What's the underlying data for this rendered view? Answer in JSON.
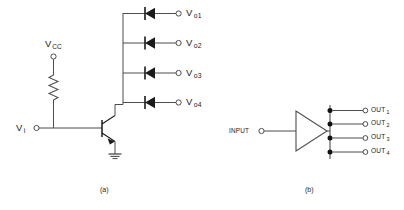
{
  "figure": {
    "background_color": "#ffffff",
    "line_color": "#4d4d4d",
    "symbol_color": "#111111",
    "text_color": "#1a1a1a",
    "width": 404,
    "height": 210
  },
  "panel_a": {
    "caption": "(a)",
    "supply": {
      "label_main": "V",
      "label_sub": "CC",
      "terminal": "open-circle"
    },
    "input": {
      "label_main": "V",
      "label_sub": "i",
      "terminal": "open-circle"
    },
    "resistor": {
      "name": "base-resistor",
      "style": "zigzag"
    },
    "transistor": {
      "type": "npn",
      "terminals": [
        "base",
        "collector",
        "emitter"
      ]
    },
    "ground": {
      "symbol": "earth-ground"
    },
    "outputs": [
      {
        "label_main": "V",
        "label_sub": "o1",
        "terminal": "open-circle",
        "device": "diode"
      },
      {
        "label_main": "V",
        "label_sub": "o2",
        "terminal": "open-circle",
        "device": "diode"
      },
      {
        "label_main": "V",
        "label_sub": "o3",
        "terminal": "open-circle",
        "device": "diode"
      },
      {
        "label_main": "V",
        "label_sub": "o4",
        "terminal": "open-circle",
        "device": "diode"
      }
    ]
  },
  "panel_b": {
    "caption": "(b)",
    "input": {
      "label": "INPUT",
      "terminal": "open-circle"
    },
    "buffer": {
      "shape": "triangle",
      "name": "buffer-amplifier"
    },
    "bus": {
      "junction_style": "filled-dot",
      "junction_count": 4
    },
    "outputs": [
      {
        "label_main": "OUT",
        "label_sub": "1",
        "terminal": "open-circle"
      },
      {
        "label_main": "OUT",
        "label_sub": "2",
        "terminal": "open-circle"
      },
      {
        "label_main": "OUT",
        "label_sub": "3",
        "terminal": "open-circle"
      },
      {
        "label_main": "OUT",
        "label_sub": "4",
        "terminal": "open-circle"
      }
    ]
  }
}
